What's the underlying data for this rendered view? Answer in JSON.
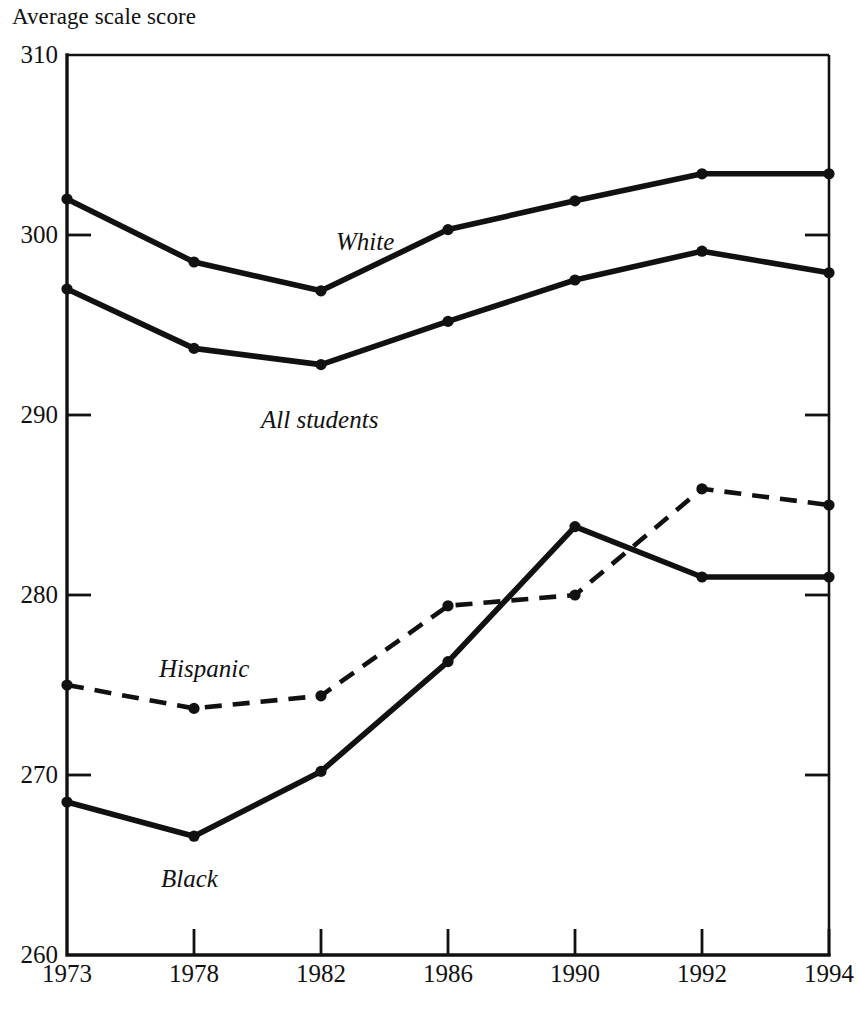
{
  "chart_data": {
    "type": "line",
    "title": "Average scale score",
    "xlabel": "",
    "ylabel": "Average scale score",
    "categories": [
      "1973",
      "1978",
      "1982",
      "1986",
      "1990",
      "1992",
      "1994"
    ],
    "ylim": [
      260,
      310
    ],
    "yticks": [
      310,
      300,
      290,
      280,
      270,
      260
    ],
    "ytick_labels": [
      "310",
      "300",
      "290",
      "280",
      "270",
      "260"
    ],
    "grid": false,
    "legend": "inline-labels",
    "series": [
      {
        "name": "White",
        "style": "solid",
        "label_x": "1982",
        "values": [
          302,
          298.5,
          296.9,
          300.3,
          301.9,
          303.4,
          303.4
        ]
      },
      {
        "name": "All students",
        "style": "solid",
        "label_x": "1982",
        "values": [
          297,
          293.7,
          292.8,
          295.2,
          297.5,
          299.1,
          297.9
        ]
      },
      {
        "name": "Hispanic",
        "style": "dashed",
        "label_x": "1978",
        "values": [
          275,
          273.7,
          274.4,
          279.4,
          280.0,
          285.9,
          285.0
        ]
      },
      {
        "name": "Black",
        "style": "solid",
        "label_x": "1978",
        "values": [
          268.5,
          266.6,
          270.2,
          276.3,
          283.8,
          281.0,
          281.0
        ]
      }
    ]
  },
  "labels": {
    "white": "White",
    "all_students": "All students",
    "hispanic": "Hispanic",
    "black": "Black"
  },
  "colors": {
    "ink": "#111111",
    "background": "#ffffff"
  }
}
